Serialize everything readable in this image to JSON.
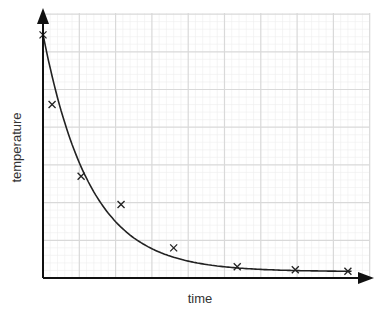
{
  "chart_data": {
    "type": "scatter",
    "title": "",
    "xlabel": "time",
    "ylabel": "temperature",
    "grid": true,
    "x_major_gridlines": 9,
    "y_major_gridlines": 7,
    "axis_ticks_labeled": false,
    "xlim": [
      0,
      9
    ],
    "ylim": [
      0,
      7
    ],
    "series": [
      {
        "name": "measurements",
        "marker": "x",
        "x": [
          0.0,
          0.25,
          1.05,
          2.15,
          3.6,
          5.35,
          6.95,
          8.4
        ],
        "y": [
          6.45,
          4.6,
          2.7,
          1.95,
          0.8,
          0.3,
          0.22,
          0.18
        ]
      }
    ],
    "fit_curve": {
      "type": "exponential decay",
      "description": "smooth best-fit curve through points"
    }
  },
  "labels": {
    "x": "time",
    "y": "temperature"
  },
  "colors": {
    "axis": "#111111",
    "grid_major": "#d9d9d9",
    "grid_minor": "#eeeeee",
    "curve": "#222222",
    "marker": "#222222"
  }
}
